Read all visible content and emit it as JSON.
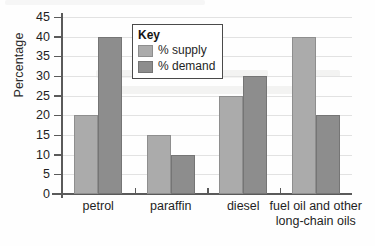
{
  "chart_data": {
    "type": "bar",
    "title": "",
    "xlabel": "",
    "ylabel": "Percentage",
    "ylim": [
      0,
      45
    ],
    "ytick_step": 5,
    "yticks": [
      "0",
      "5",
      "10",
      "15",
      "20",
      "25",
      "30",
      "35",
      "40",
      "45"
    ],
    "grid": true,
    "legend_position": "inside-upper-left",
    "legend_title": "Key",
    "categories": [
      "petrol",
      "paraffin",
      "diesel",
      "fuel oil and other long-chain oils"
    ],
    "category_lines": [
      [
        "petrol"
      ],
      [
        "paraffin"
      ],
      [
        "diesel"
      ],
      [
        "fuel oil and other",
        "long-chain oils"
      ]
    ],
    "series": [
      {
        "name": "% supply",
        "color": "#ababab",
        "values": [
          20,
          15,
          25,
          40
        ]
      },
      {
        "name": "% demand",
        "color": "#8d8d8d",
        "values": [
          40,
          10,
          30,
          20
        ]
      }
    ]
  },
  "style": {
    "axis_color": "#5a5a5a",
    "grid_color": "#e2e2e2",
    "text_color": "#1f1f1f",
    "background": "#ffffff",
    "legend_border": "#4a4a4a"
  }
}
